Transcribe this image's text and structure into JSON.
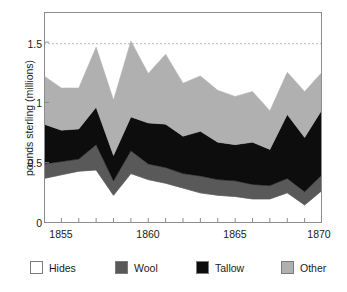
{
  "chart_data": {
    "type": "area",
    "title": "",
    "subtitle": "",
    "xlabel": "",
    "ylabel": "pounds sterling (millions)",
    "xlim": [
      1854,
      1870
    ],
    "ylim": [
      0,
      1.75
    ],
    "x": [
      1854,
      1855,
      1856,
      1857,
      1858,
      1859,
      1860,
      1861,
      1862,
      1863,
      1864,
      1865,
      1866,
      1867,
      1868,
      1869,
      1870
    ],
    "xticklabels": [
      "1855",
      "1860",
      "1865",
      "1870"
    ],
    "xtickvalues": [
      1855,
      1860,
      1865,
      1870
    ],
    "yticklabels": [
      "0",
      "0.5",
      "1",
      "1.5"
    ],
    "ytickvalues": [
      0,
      0.5,
      1,
      1.5
    ],
    "grid": "horizontal-dashed-at-1.5",
    "stacked": true,
    "stack_order_bottom_to_top": [
      "Hides",
      "Wool",
      "Tallow",
      "Other"
    ],
    "legend_position": "below",
    "series": [
      {
        "name": "Hides",
        "color": "#ffffff",
        "values": [
          0.37,
          0.4,
          0.43,
          0.44,
          0.23,
          0.41,
          0.36,
          0.33,
          0.29,
          0.25,
          0.23,
          0.22,
          0.2,
          0.2,
          0.25,
          0.15,
          0.27
        ]
      },
      {
        "name": "Wool",
        "color": "#595959",
        "values": [
          0.12,
          0.11,
          0.1,
          0.21,
          0.12,
          0.19,
          0.13,
          0.13,
          0.12,
          0.14,
          0.13,
          0.13,
          0.12,
          0.11,
          0.12,
          0.11,
          0.13
        ]
      },
      {
        "name": "Tallow",
        "color": "#0d0d0d",
        "values": [
          0.33,
          0.26,
          0.25,
          0.31,
          0.21,
          0.28,
          0.34,
          0.36,
          0.31,
          0.37,
          0.31,
          0.3,
          0.35,
          0.3,
          0.53,
          0.45,
          0.54
        ]
      },
      {
        "name": "Other",
        "color": "#b0b0b0",
        "values": [
          0.4,
          0.35,
          0.34,
          0.5,
          0.46,
          0.63,
          0.41,
          0.58,
          0.44,
          0.46,
          0.43,
          0.4,
          0.42,
          0.32,
          0.35,
          0.38,
          0.31
        ]
      }
    ],
    "totals": [
      1.22,
      1.12,
      1.12,
      1.46,
      1.02,
      1.51,
      1.24,
      1.4,
      1.16,
      1.22,
      1.1,
      1.05,
      1.09,
      0.93,
      1.25,
      1.09,
      1.25
    ]
  },
  "legend": {
    "items": [
      {
        "label": "Hides",
        "color": "#ffffff"
      },
      {
        "label": "Wool",
        "color": "#595959"
      },
      {
        "label": "Tallow",
        "color": "#0d0d0d"
      },
      {
        "label": "Other",
        "color": "#b0b0b0"
      }
    ]
  },
  "axes": {
    "y_title": "pounds sterling (millions)",
    "y_tick_0": "0",
    "y_tick_1": "0.5",
    "y_tick_2": "1",
    "y_tick_3": "1.5",
    "x_tick_0": "1855",
    "x_tick_1": "1860",
    "x_tick_2": "1865",
    "x_tick_3": "1870"
  },
  "colors": {
    "axis": "#8c8c8c",
    "text": "#1a1a1a",
    "gridline": "#b5b5b5",
    "background": "#ffffff"
  }
}
